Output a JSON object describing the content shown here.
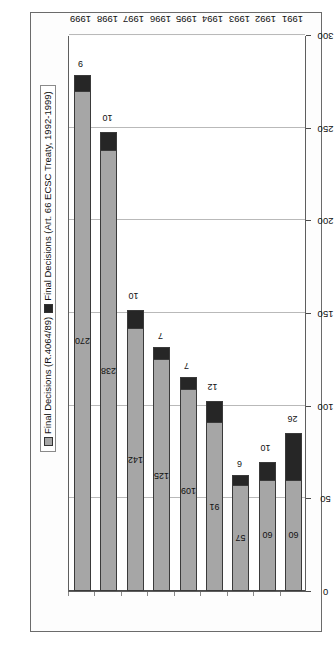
{
  "chart_data": {
    "type": "bar",
    "orientation": "horizontal-stacked",
    "title": "",
    "xlabel": "",
    "ylabel": "",
    "categories": [
      "1991",
      "1992",
      "1993",
      "1994",
      "1995",
      "1996",
      "1997",
      "1998",
      "1999"
    ],
    "series": [
      {
        "name": "Final Decisions (R.4064/89)",
        "color": "#a6a6a6",
        "values": [
          60,
          60,
          57,
          91,
          109,
          125,
          142,
          238,
          270
        ]
      },
      {
        "name": "Final Decisions (Art. 66 ECSC Treaty, 1992-1999)",
        "color": "#262626",
        "values": [
          26,
          10,
          6,
          12,
          7,
          7,
          10,
          10,
          9
        ]
      }
    ],
    "xlim": [
      0,
      300
    ],
    "xticks": [
      0,
      50,
      100,
      150,
      200,
      250,
      300
    ],
    "xtick_labels": [
      "0",
      "50",
      "100",
      "150",
      "200",
      "250",
      "300"
    ],
    "grid": true,
    "legend_position": "top-left"
  },
  "legend": {
    "items": [
      {
        "label": "Final Decisions (R.4064/89)",
        "swatch": "gray-square-icon"
      },
      {
        "label": "Final Decisions (Art. 66 ECSC Treaty, 1992-1999)",
        "swatch": "black-square-icon"
      }
    ]
  },
  "axis": {
    "value_ticks": [
      "0",
      "50",
      "100",
      "150",
      "200",
      "250",
      "300"
    ],
    "category_ticks": [
      "1991",
      "1992",
      "1993",
      "1994",
      "1995",
      "1996",
      "1997",
      "1998",
      "1999"
    ]
  },
  "bar_labels": {
    "primary": [
      "60",
      "60",
      "57",
      "91",
      "109",
      "125",
      "142",
      "238",
      "270"
    ],
    "secondary": [
      "26",
      "10",
      "6",
      "12",
      "7",
      "7",
      "10",
      "10",
      "9"
    ]
  }
}
